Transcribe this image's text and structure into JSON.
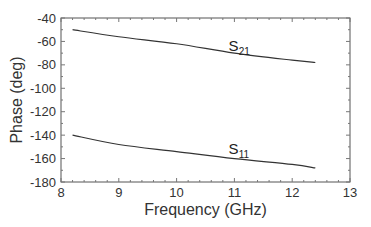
{
  "chart_data": {
    "type": "line",
    "title": "",
    "xlabel": "Frequency (GHz)",
    "ylabel": "Phase (deg)",
    "xlim": [
      8,
      13
    ],
    "ylim": [
      -180,
      -40
    ],
    "xticks": [
      8,
      9,
      10,
      11,
      12,
      13
    ],
    "yticks": [
      -40,
      -60,
      -80,
      -100,
      -120,
      -140,
      -160,
      -180
    ],
    "grid": false,
    "legend": "inline labels",
    "series": [
      {
        "name": "S21",
        "label_main": "S",
        "label_sub": "21",
        "x": [
          8.2,
          9,
          10,
          11,
          12,
          12.4
        ],
        "values": [
          -50,
          -56,
          -62,
          -70,
          -76,
          -78
        ],
        "color": "#333333",
        "label_pos": [
          10.9,
          -68
        ]
      },
      {
        "name": "S11",
        "label_main": "S",
        "label_sub": "11",
        "x": [
          8.2,
          9,
          10,
          11,
          12,
          12.4
        ],
        "values": [
          -140,
          -148,
          -154,
          -160,
          -165,
          -168
        ],
        "color": "#333333",
        "label_pos": [
          10.9,
          -156
        ]
      }
    ]
  }
}
